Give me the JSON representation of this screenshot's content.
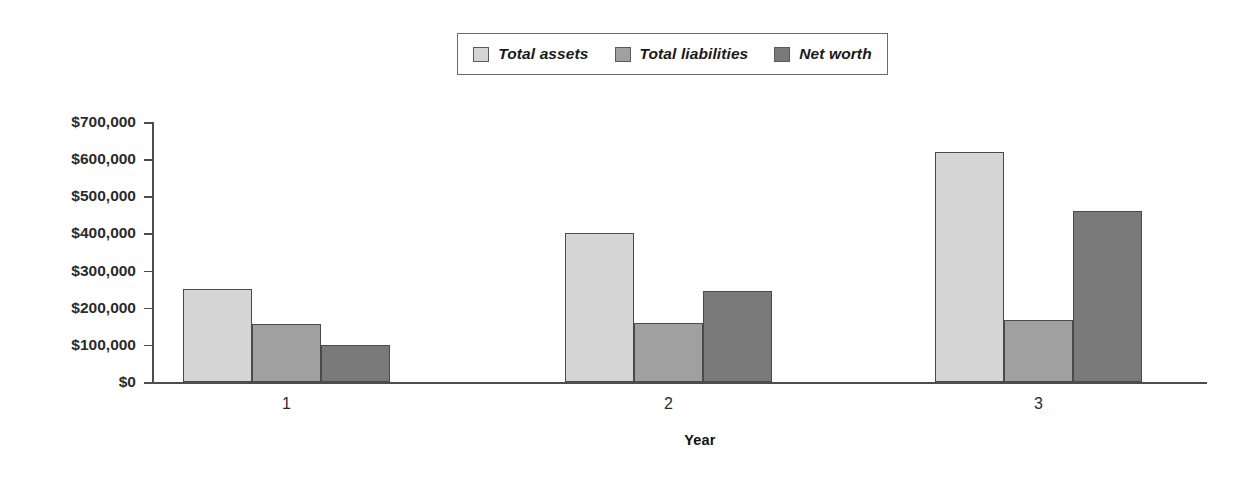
{
  "chart_data": {
    "type": "bar",
    "title": "",
    "xlabel": "Year",
    "ylabel": "",
    "categories": [
      "1",
      "2",
      "3"
    ],
    "series": [
      {
        "name": "Total assets",
        "color": "#d5d5d5",
        "values": [
          250000,
          400000,
          620000
        ]
      },
      {
        "name": "Total liabilities",
        "color": "#a0a0a0",
        "values": [
          155000,
          160000,
          168000
        ]
      },
      {
        "name": "Net worth",
        "color": "#7a7a7a",
        "values": [
          100000,
          245000,
          460000
        ]
      }
    ],
    "ylim": [
      0,
      700000
    ],
    "ytick_values": [
      0,
      100000,
      200000,
      300000,
      400000,
      500000,
      600000,
      700000
    ],
    "ytick_labels": [
      "$0",
      "$100,000",
      "$200,000",
      "$300,000",
      "$400,000",
      "$500,000",
      "$600,000",
      "$700,000"
    ],
    "grid": false,
    "legend_position": "top-center"
  },
  "legend": {
    "items": [
      {
        "label": "Total assets"
      },
      {
        "label": "Total liabilities"
      },
      {
        "label": "Net worth"
      }
    ]
  },
  "axis": {
    "x_title": "Year"
  }
}
